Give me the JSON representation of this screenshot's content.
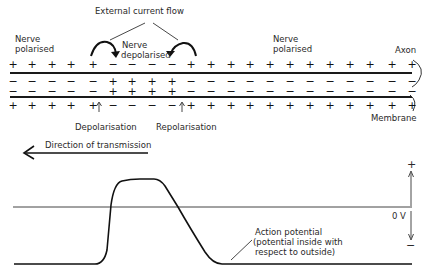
{
  "diagram": {
    "labels": {
      "external_current_flow": "External current flow",
      "nerve_polarised_left_1": "Nerve",
      "nerve_polarised_left_2": "polarised",
      "nerve_depolarised_1": "Nerve",
      "nerve_depolarised_2": "depolarised",
      "nerve_polarised_right_1": "Nerve",
      "nerve_polarised_right_2": "polarised",
      "axon": "Axon",
      "membrane": "Membrane",
      "depolarisation": "Depolarisation",
      "repolarisation": "Repolarisation",
      "direction_of_transmission": "Direction of transmission",
      "plus_axis": "+",
      "minus_axis": "−",
      "zero_volts": "0 V",
      "action_potential_1": "Action potential",
      "action_potential_2": "(potential inside with",
      "action_potential_3": "respect to outside)"
    },
    "membrane_rows": {
      "outer_top": [
        "+",
        "+",
        "+",
        "+",
        "+",
        "−",
        "−",
        "−",
        "−",
        "+",
        "+",
        "+",
        "+",
        "+",
        "+",
        "+",
        "+",
        "+",
        "+",
        "+",
        "+"
      ],
      "inner_top": [
        "−",
        "−",
        "−",
        "−",
        "−",
        "+",
        "+",
        "+",
        "+",
        "−",
        "−",
        "−",
        "−",
        "−",
        "−",
        "−",
        "−",
        "−",
        "−",
        "−",
        "−"
      ],
      "inner_bottom": [
        "−",
        "−",
        "−",
        "−",
        "−",
        "+",
        "+",
        "+",
        "+",
        "−",
        "−",
        "−",
        "−",
        "−",
        "−",
        "−",
        "−",
        "−",
        "−",
        "−",
        "−"
      ],
      "outer_bottom": [
        "+",
        "+",
        "+",
        "+",
        "+",
        "−",
        "−",
        "−",
        "−",
        "+",
        "+",
        "+",
        "+",
        "+",
        "+",
        "+",
        "+",
        "+",
        "+",
        "+",
        "+"
      ]
    },
    "column_x": [
      13,
      32,
      52,
      71,
      93,
      113,
      132,
      152,
      172,
      191,
      211,
      231,
      250,
      270,
      290,
      310,
      330,
      350,
      370,
      392,
      412
    ],
    "colors": {
      "ink": "#1a1a1a",
      "line": "#333333"
    }
  }
}
